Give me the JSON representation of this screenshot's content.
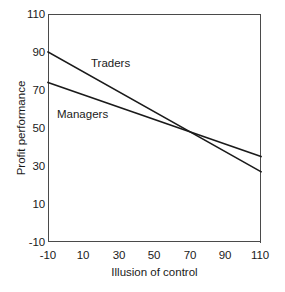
{
  "chart_data": {
    "type": "line",
    "title": "",
    "xlabel": "Illusion of control",
    "ylabel": "Profit performance",
    "xlim": [
      -10,
      110
    ],
    "ylim": [
      -10,
      110
    ],
    "xticks": [
      "-10",
      "10",
      "30",
      "50",
      "70",
      "90",
      "110"
    ],
    "yticks": [
      "-10",
      "10",
      "30",
      "50",
      "70",
      "90",
      "110"
    ],
    "xtick_values": [
      -10,
      10,
      30,
      50,
      70,
      90,
      110
    ],
    "ytick_values": [
      -10,
      10,
      30,
      50,
      70,
      90,
      110
    ],
    "grid": false,
    "legend": "inline-labels",
    "line_color": "#1a1a1a",
    "axis_color": "#4a4a4a",
    "background": "#ffffff",
    "x": [
      -10,
      110
    ],
    "series": [
      {
        "name": "Traders",
        "values": [
          90,
          27
        ],
        "label_x": 30,
        "label_y": 76
      },
      {
        "name": "Managers",
        "values": [
          74,
          35
        ],
        "label_x": 0,
        "label_y": 49
      }
    ],
    "annotations": [
      {
        "text": "Traders",
        "x": 30,
        "y": 76
      },
      {
        "text": "Managers",
        "x": 0,
        "y": 49
      }
    ],
    "crossing_point": {
      "x": 72,
      "y": 48
    }
  },
  "page_caption_sliver": ""
}
